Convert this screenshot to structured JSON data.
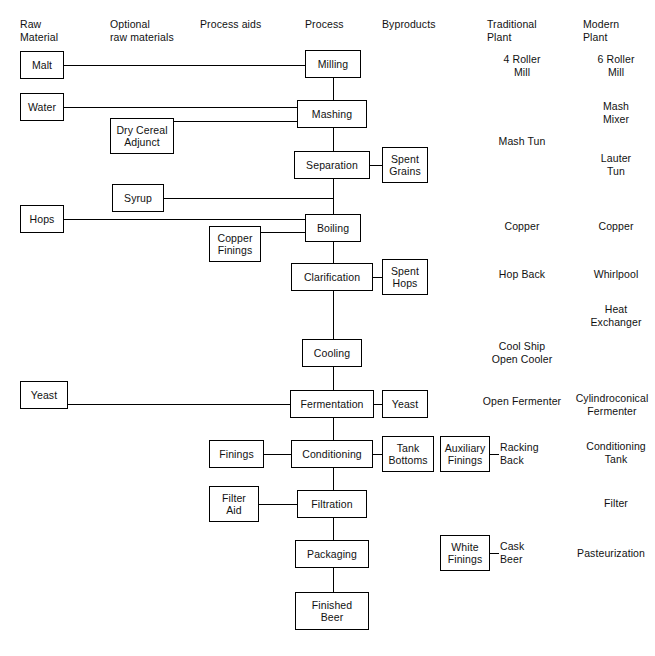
{
  "diagram": {
    "columns": [
      {
        "id": "raw-material",
        "label": "Raw\nMaterial",
        "x": 20,
        "y": 18,
        "align": "left"
      },
      {
        "id": "optional-raw",
        "label": "Optional\nraw materials",
        "x": 110,
        "y": 18,
        "align": "left"
      },
      {
        "id": "process-aids",
        "label": "Process aids",
        "x": 200,
        "y": 18,
        "align": "left"
      },
      {
        "id": "process",
        "label": "Process",
        "x": 305,
        "y": 18,
        "align": "left"
      },
      {
        "id": "byproducts",
        "label": "Byproducts",
        "x": 382,
        "y": 18,
        "align": "left"
      },
      {
        "id": "traditional-plant",
        "label": "Traditional\nPlant",
        "x": 487,
        "y": 18,
        "align": "left"
      },
      {
        "id": "modern-plant",
        "label": "Modern\nPlant",
        "x": 583,
        "y": 18,
        "align": "left"
      }
    ],
    "process_boxes": [
      {
        "id": "milling",
        "label": "Milling",
        "x": 305,
        "y": 50,
        "w": 56,
        "h": 28
      },
      {
        "id": "mashing",
        "label": "Mashing",
        "x": 297,
        "y": 100,
        "w": 70,
        "h": 28
      },
      {
        "id": "separation",
        "label": "Separation",
        "x": 294,
        "y": 151,
        "w": 76,
        "h": 28
      },
      {
        "id": "boiling",
        "label": "Boiling",
        "x": 305,
        "y": 214,
        "w": 56,
        "h": 28
      },
      {
        "id": "clarification",
        "label": "Clarification",
        "x": 291,
        "y": 263,
        "w": 82,
        "h": 28
      },
      {
        "id": "cooling",
        "label": "Cooling",
        "x": 302,
        "y": 339,
        "w": 60,
        "h": 28
      },
      {
        "id": "fermentation",
        "label": "Fermentation",
        "x": 290,
        "y": 390,
        "w": 84,
        "h": 28
      },
      {
        "id": "conditioning",
        "label": "Conditioning",
        "x": 291,
        "y": 440,
        "w": 82,
        "h": 28
      },
      {
        "id": "filtration",
        "label": "Filtration",
        "x": 297,
        "y": 490,
        "w": 70,
        "h": 28
      },
      {
        "id": "packaging",
        "label": "Packaging",
        "x": 295,
        "y": 540,
        "w": 74,
        "h": 28
      },
      {
        "id": "finished-beer",
        "label": "Finished\nBeer",
        "x": 295,
        "y": 592,
        "w": 74,
        "h": 38
      }
    ],
    "raw_material_boxes": [
      {
        "id": "malt",
        "label": "Malt",
        "x": 20,
        "y": 51,
        "w": 44,
        "h": 28
      },
      {
        "id": "water",
        "label": "Water",
        "x": 20,
        "y": 93,
        "w": 44,
        "h": 28
      },
      {
        "id": "hops",
        "label": "Hops",
        "x": 20,
        "y": 205,
        "w": 44,
        "h": 28
      },
      {
        "id": "yeast-raw",
        "label": "Yeast",
        "x": 20,
        "y": 381,
        "w": 48,
        "h": 28
      }
    ],
    "optional_raw_boxes": [
      {
        "id": "dry-cereal-adjunct",
        "label": "Dry Cereal\nAdjunct",
        "x": 110,
        "y": 118,
        "w": 64,
        "h": 36
      },
      {
        "id": "syrup",
        "label": "Syrup",
        "x": 112,
        "y": 184,
        "w": 52,
        "h": 28
      }
    ],
    "process_aid_boxes": [
      {
        "id": "copper-finings",
        "label": "Copper\nFinings",
        "x": 209,
        "y": 226,
        "w": 52,
        "h": 36
      },
      {
        "id": "finings",
        "label": "Finings",
        "x": 209,
        "y": 440,
        "w": 55,
        "h": 28
      },
      {
        "id": "filter-aid",
        "label": "Filter\nAid",
        "x": 209,
        "y": 486,
        "w": 50,
        "h": 36
      }
    ],
    "byproduct_boxes": [
      {
        "id": "spent-grains",
        "label": "Spent\nGrains",
        "x": 382,
        "y": 147,
        "w": 46,
        "h": 36
      },
      {
        "id": "spent-hops",
        "label": "Spent\nHops",
        "x": 382,
        "y": 259,
        "w": 46,
        "h": 36
      },
      {
        "id": "yeast-byproduct",
        "label": "Yeast",
        "x": 382,
        "y": 390,
        "w": 46,
        "h": 28
      },
      {
        "id": "tank-bottoms",
        "label": "Tank\nBottoms",
        "x": 382,
        "y": 436,
        "w": 52,
        "h": 36
      }
    ],
    "finings_tag_boxes": [
      {
        "id": "auxiliary-finings",
        "label": "Auxiliary\nFinings",
        "x": 440,
        "y": 436,
        "w": 50,
        "h": 36,
        "tag": "Racking\nBack",
        "tag_x": 500,
        "tag_y": 440
      },
      {
        "id": "white-finings",
        "label": "White\nFinings",
        "x": 440,
        "y": 535,
        "w": 50,
        "h": 36,
        "tag": "Cask\nBeer",
        "tag_x": 500,
        "tag_y": 539
      }
    ],
    "traditional_plant_labels": [
      {
        "id": "trad-4-roller-mill",
        "label": "4 Roller\nMill",
        "x": 487,
        "y": 53,
        "w": 70
      },
      {
        "id": "trad-mash-tun",
        "label": "Mash Tun",
        "x": 487,
        "y": 135,
        "w": 70
      },
      {
        "id": "trad-copper",
        "label": "Copper",
        "x": 487,
        "y": 220,
        "w": 70
      },
      {
        "id": "trad-hop-back",
        "label": "Hop Back",
        "x": 487,
        "y": 268,
        "w": 70
      },
      {
        "id": "trad-cool-ship",
        "label": "Cool Ship\nOpen Cooler",
        "x": 487,
        "y": 340,
        "w": 70
      },
      {
        "id": "trad-open-fermenter",
        "label": "Open Fermenter",
        "x": 470,
        "y": 395,
        "w": 104
      }
    ],
    "modern_plant_labels": [
      {
        "id": "mod-6-roller-mill",
        "label": "6 Roller\nMill",
        "x": 583,
        "y": 53,
        "w": 66
      },
      {
        "id": "mod-mash-mixer",
        "label": "Mash\nMixer",
        "x": 583,
        "y": 100,
        "w": 66
      },
      {
        "id": "mod-lauter-tun",
        "label": "Lauter\nTun",
        "x": 583,
        "y": 152,
        "w": 66
      },
      {
        "id": "mod-copper",
        "label": "Copper",
        "x": 583,
        "y": 220,
        "w": 66
      },
      {
        "id": "mod-whirlpool",
        "label": "Whirlpool",
        "x": 583,
        "y": 268,
        "w": 66
      },
      {
        "id": "mod-heat-exchanger",
        "label": "Heat\nExchanger",
        "x": 578,
        "y": 303,
        "w": 76
      },
      {
        "id": "mod-cylindroconical",
        "label": "Cylindroconical\nFermenter",
        "x": 568,
        "y": 392,
        "w": 88
      },
      {
        "id": "mod-conditioning-tank",
        "label": "Conditioning\nTank",
        "x": 578,
        "y": 440,
        "w": 76
      },
      {
        "id": "mod-filter",
        "label": "Filter",
        "x": 583,
        "y": 497,
        "w": 66
      },
      {
        "id": "mod-pasteurization",
        "label": "Pasteurization",
        "x": 566,
        "y": 547,
        "w": 90
      }
    ],
    "connectors": {
      "vertical_spine": [
        {
          "id": "spine-milling-mashing",
          "x": 333,
          "y": 78,
          "len": 22
        },
        {
          "id": "spine-mashing-separation",
          "x": 333,
          "y": 128,
          "len": 23
        },
        {
          "id": "spine-separation-boiling",
          "x": 333,
          "y": 179,
          "len": 35
        },
        {
          "id": "spine-boiling-clarification",
          "x": 333,
          "y": 242,
          "len": 21
        },
        {
          "id": "spine-clarification-cooling",
          "x": 333,
          "y": 291,
          "len": 48
        },
        {
          "id": "spine-cooling-fermentation",
          "x": 333,
          "y": 367,
          "len": 23
        },
        {
          "id": "spine-fermentation-conditioning",
          "x": 333,
          "y": 418,
          "len": 22
        },
        {
          "id": "spine-conditioning-filtration",
          "x": 333,
          "y": 468,
          "len": 22
        },
        {
          "id": "spine-filtration-packaging",
          "x": 333,
          "y": 518,
          "len": 22
        },
        {
          "id": "spine-packaging-finished",
          "x": 333,
          "y": 568,
          "len": 24
        }
      ],
      "horizontal": [
        {
          "id": "link-malt-milling",
          "x": 64,
          "y": 65,
          "len": 241
        },
        {
          "id": "link-water-mashing",
          "x": 64,
          "y": 107,
          "len": 233
        },
        {
          "id": "link-adjunct-mashing",
          "x": 174,
          "y": 121,
          "len": 123
        },
        {
          "id": "link-separation-spentgrains",
          "x": 370,
          "y": 165,
          "len": 12
        },
        {
          "id": "link-syrup-boiling",
          "x": 164,
          "y": 198,
          "len": 169
        },
        {
          "id": "link-hops-boiling",
          "x": 64,
          "y": 219,
          "len": 241
        },
        {
          "id": "link-copperfinings-boiling",
          "x": 261,
          "y": 232,
          "len": 44
        },
        {
          "id": "link-clarification-spenthops",
          "x": 373,
          "y": 277,
          "len": 9
        },
        {
          "id": "link-yeast-fermentation",
          "x": 68,
          "y": 404,
          "len": 222
        },
        {
          "id": "link-fermentation-yeastby",
          "x": 374,
          "y": 404,
          "len": 8
        },
        {
          "id": "link-finings-conditioning",
          "x": 264,
          "y": 454,
          "len": 27
        },
        {
          "id": "link-conditioning-tankbottoms",
          "x": 373,
          "y": 454,
          "len": 9
        },
        {
          "id": "link-auxfinings-racking",
          "x": 490,
          "y": 454,
          "len": 9
        },
        {
          "id": "link-filteraid-filtration",
          "x": 259,
          "y": 504,
          "len": 38
        },
        {
          "id": "link-whitefinings-cask",
          "x": 490,
          "y": 553,
          "len": 9
        }
      ]
    }
  }
}
